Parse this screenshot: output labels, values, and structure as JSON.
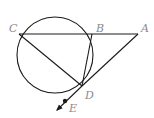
{
  "diagram": {
    "type": "geometry",
    "circle": {
      "cx": 55,
      "cy": 55,
      "r": 38
    },
    "points": {
      "C": {
        "label": "C",
        "x": 19,
        "y": 34,
        "lx": 9,
        "ly": 32
      },
      "B": {
        "label": "B",
        "x": 92,
        "y": 34,
        "lx": 96,
        "ly": 32
      },
      "A": {
        "label": "A",
        "x": 138,
        "y": 34,
        "lx": 141,
        "ly": 32
      },
      "D": {
        "label": "D",
        "x": 82,
        "y": 86,
        "lx": 85,
        "ly": 99
      },
      "E": {
        "label": "E",
        "x": 64,
        "y": 102,
        "lx": 69,
        "ly": 112
      }
    },
    "segments": [
      {
        "name": "CA",
        "from": "C",
        "to": "A"
      },
      {
        "name": "CD",
        "from": "C",
        "to": "D"
      },
      {
        "name": "BD",
        "from": "B",
        "to": "D"
      },
      {
        "name": "AD-tangent",
        "from": "A",
        "to": "D"
      },
      {
        "name": "DE-ray",
        "from": "D",
        "to": "E"
      }
    ],
    "colors": {
      "stroke": "#1a1a1a",
      "label": "#8a8a8a"
    }
  }
}
